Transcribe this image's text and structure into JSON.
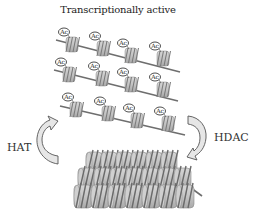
{
  "diagram": {
    "title": "Transcriptionally active",
    "left_arrow_label": "HAT",
    "right_arrow_label": "HDAC",
    "acetyl_label": "Ac",
    "colors": {
      "nucleosome": "#b9b9b9",
      "dna": "#6e6e6e",
      "arrow_fill": "#e6e6e6",
      "arrow_stroke": "#555555",
      "text": "#222222"
    },
    "rows": [
      {
        "nucleosomes": [
          [
            72,
            45
          ],
          [
            103,
            49
          ],
          [
            131,
            56
          ],
          [
            163,
            59
          ]
        ],
        "dna": [
          [
            56,
            40
          ],
          [
            180,
            72
          ]
        ]
      },
      {
        "nucleosomes": [
          [
            69,
            75
          ],
          [
            102,
            79
          ],
          [
            131,
            85
          ],
          [
            163,
            90
          ]
        ],
        "dna": [
          [
            54,
            70
          ],
          [
            178,
            101
          ]
        ]
      },
      {
        "nucleosomes": [
          [
            76,
            110
          ],
          [
            108,
            114
          ],
          [
            137,
            121
          ],
          [
            168,
            124
          ]
        ],
        "dna": [
          [
            60,
            106
          ],
          [
            185,
            135
          ]
        ]
      }
    ],
    "compact_chromatin": {
      "x": 74,
      "y": 152,
      "width": 125,
      "height": 56,
      "layers": 3
    }
  }
}
